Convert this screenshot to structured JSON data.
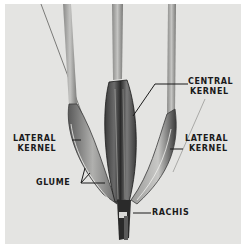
{
  "figure": {
    "background": "#e4e4e2",
    "ink": "#1a1a1a",
    "labels": {
      "central": {
        "line1": "CENTRAL",
        "line2": "KERNEL"
      },
      "lateral_left": {
        "line1": "LATERAL",
        "line2": "KERNEL"
      },
      "lateral_right": {
        "line1": "LATERAL",
        "line2": "KERNEL"
      },
      "glume": "GLUME",
      "rachis": "RACHIS"
    }
  }
}
